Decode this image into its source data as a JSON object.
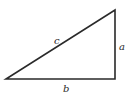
{
  "diagram": {
    "type": "right-triangle",
    "vertices": {
      "bottom_left": [
        6,
        79
      ],
      "bottom_right": [
        115,
        79
      ],
      "top_right": [
        115,
        10
      ]
    },
    "labels": {
      "hypotenuse": "c",
      "vertical_side": "a",
      "horizontal_side": "b"
    },
    "stroke_color": "#2a2a2a"
  }
}
